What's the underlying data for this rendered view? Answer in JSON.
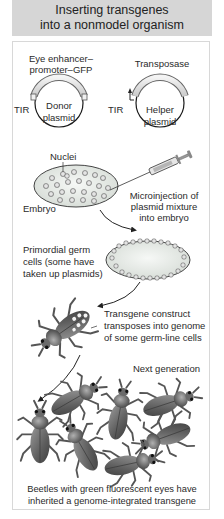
{
  "title": {
    "line1": "Inserting transgenes",
    "line2": "into a nonmodel organism"
  },
  "plasmids": {
    "donor": {
      "gene_label_line1": "Eye enhancer–",
      "gene_label_line2": "promoter–GFP",
      "name_line1": "Donor",
      "name_line2": "plasmid",
      "left_element": "TIR",
      "right_element": "TIR"
    },
    "helper": {
      "gene_label": "Transposase",
      "name_line1": "Helper",
      "name_line2": "plasmid"
    }
  },
  "embryo_step": {
    "nuclei_label": "Nuclei",
    "embryo_label": "Embryo",
    "injection_line1": "Microinjection of",
    "injection_line2": "plasmid mixture",
    "injection_line3": "into embryo"
  },
  "germ_cell_step": {
    "line1": "Primordial germ",
    "line2": "cells (some have",
    "line3": "taken up plasmids)"
  },
  "transposition_step": {
    "line1": "Transgene construct",
    "line2": "transposes into genome",
    "line3": "of some germ-line cells"
  },
  "next_generation": {
    "label": "Next generation",
    "caption_line1": "Beetles with green fluorescent eyes have",
    "caption_line2": "inherited a genome-integrated transgene",
    "beetle_count": 7
  },
  "colors": {
    "header_bg": "#d6d6d6",
    "panel_border": "#d8d8d8",
    "plasmid_band": "#e2e2e2",
    "embryo_fill": "#e4e8e4",
    "beetle_body": "#6a6a6a",
    "text": "#2a2a2a"
  }
}
